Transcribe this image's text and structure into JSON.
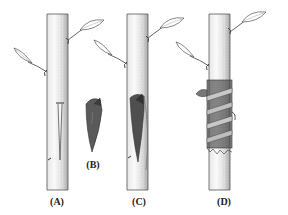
{
  "figure": {
    "panels": [
      {
        "id": "A",
        "label": "(A)",
        "description": "stem with vertical bark incision",
        "label_x": 57,
        "label_y": 196
      },
      {
        "id": "B",
        "label": "(B)",
        "description": "wedge-shaped scion",
        "label_x": 93,
        "label_y": 159
      },
      {
        "id": "C",
        "label": "(C)",
        "description": "scion inserted under bark",
        "label_x": 139,
        "label_y": 196
      },
      {
        "id": "D",
        "label": "(D)",
        "description": "graft wrapped with tape",
        "label_x": 224,
        "label_y": 196
      }
    ],
    "colors": {
      "background": "#ffffff",
      "line": "#555555",
      "shade": "#9a9a9a",
      "scion": "#5a5a5a",
      "wrap_dark": "#3a3a3a",
      "wrap_light": "#bdbdbd",
      "label": "#222222"
    }
  }
}
